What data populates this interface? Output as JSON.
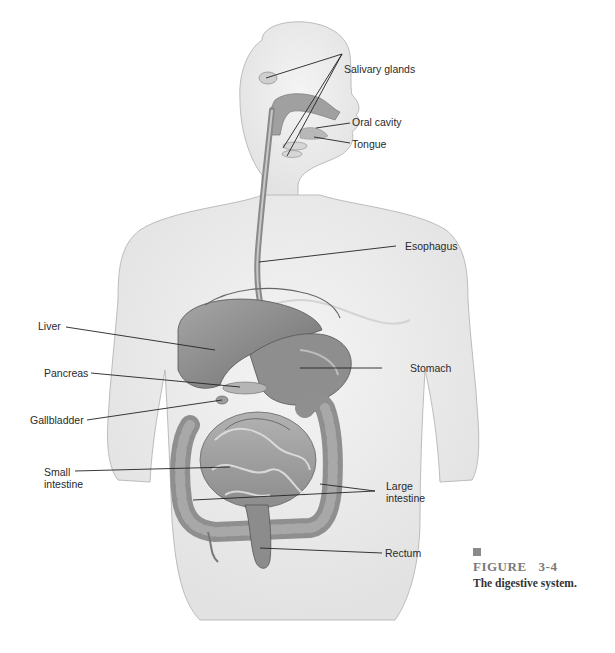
{
  "figure": {
    "number_label": "FIGURE",
    "number": "3-4",
    "caption": "The digestive system."
  },
  "labels": {
    "salivary_glands": "Salivary glands",
    "oral_cavity": "Oral cavity",
    "tongue": "Tongue",
    "esophagus": "Esophagus",
    "liver": "Liver",
    "stomach": "Stomach",
    "pancreas": "Pancreas",
    "gallbladder": "Gallbladder",
    "small_intestine": "Small intestine",
    "large_intestine": "Large intestine",
    "rectum": "Rectum"
  },
  "colors": {
    "body_fill": "#eeeeee",
    "body_outline": "#b8b8b8",
    "organ_dark": "#7d7d7d",
    "organ_mid": "#9a9a9a",
    "organ_light": "#c4c4c4",
    "leader_line": "#222222",
    "caption_mark": "#8a8a8a"
  }
}
